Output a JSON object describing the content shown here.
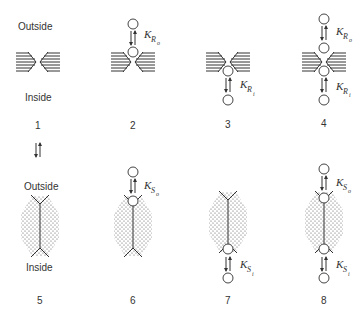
{
  "labels": {
    "outside_top": "Outside",
    "inside_top": "Inside",
    "outside_bottom": "Outside",
    "inside_bottom": "Inside"
  },
  "panels": [
    {
      "number": "1",
      "state": "R",
      "bound_outside": false,
      "bound_inside": false
    },
    {
      "number": "2",
      "state": "R",
      "bound_outside": true,
      "bound_inside": false,
      "k_outside": {
        "K": "K",
        "sub": "R",
        "subsub": "o"
      }
    },
    {
      "number": "3",
      "state": "R",
      "bound_outside": false,
      "bound_inside": true,
      "k_inside": {
        "K": "K",
        "sub": "R",
        "subsub": "i"
      }
    },
    {
      "number": "4",
      "state": "R",
      "bound_outside": true,
      "bound_inside": true,
      "k_outside": {
        "K": "K",
        "sub": "R",
        "subsub": "o"
      },
      "k_inside": {
        "K": "K",
        "sub": "R",
        "subsub": "i"
      }
    },
    {
      "number": "5",
      "state": "S",
      "bound_outside": false,
      "bound_inside": false
    },
    {
      "number": "6",
      "state": "S",
      "bound_outside": true,
      "bound_inside": false,
      "k_outside": {
        "K": "K",
        "sub": "S",
        "subsub": "o"
      }
    },
    {
      "number": "7",
      "state": "S",
      "bound_outside": false,
      "bound_inside": true,
      "k_inside": {
        "K": "K",
        "sub": "S",
        "subsub": "i"
      }
    },
    {
      "number": "8",
      "state": "S",
      "bound_outside": true,
      "bound_inside": true,
      "k_outside": {
        "K": "K",
        "sub": "S",
        "subsub": "o"
      },
      "k_inside": {
        "K": "K",
        "sub": "S",
        "subsub": "i"
      }
    }
  ],
  "transition_arrow": {
    "from": "1",
    "to": "5",
    "symbol": "⇅"
  }
}
